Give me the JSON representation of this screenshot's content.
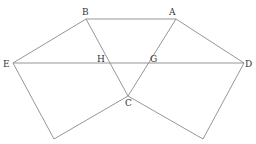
{
  "diagram": {
    "type": "geometry-figure",
    "points": {
      "A": {
        "label": "A",
        "x": 176,
        "y": 19,
        "lx": 169,
        "ly": 15
      },
      "B": {
        "label": "B",
        "x": 86,
        "y": 19,
        "lx": 82,
        "ly": 15
      },
      "C": {
        "label": "C",
        "x": 128,
        "y": 96,
        "lx": 125,
        "ly": 106
      },
      "D": {
        "label": "D",
        "x": 244,
        "y": 63,
        "lx": 245,
        "ly": 67
      },
      "E": {
        "label": "E",
        "x": 13,
        "y": 63,
        "lx": 3,
        "ly": 67
      },
      "G": {
        "label": "G",
        "x": 148,
        "y": 63,
        "lx": 150,
        "ly": 62
      },
      "H": {
        "label": "H",
        "x": 110,
        "y": 63,
        "lx": 97,
        "ly": 62
      },
      "P1": {
        "label": "",
        "x": 54,
        "y": 139
      },
      "P2": {
        "label": "",
        "x": 203,
        "y": 139
      }
    },
    "segments": [
      [
        "B",
        "A"
      ],
      [
        "B",
        "E"
      ],
      [
        "A",
        "D"
      ],
      [
        "E",
        "D"
      ],
      [
        "B",
        "C"
      ],
      [
        "A",
        "C"
      ],
      [
        "E",
        "P1"
      ],
      [
        "P1",
        "C"
      ],
      [
        "C",
        "P2"
      ],
      [
        "P2",
        "D"
      ]
    ],
    "line_color": "#8a8a8a",
    "label_color": "#333333"
  }
}
